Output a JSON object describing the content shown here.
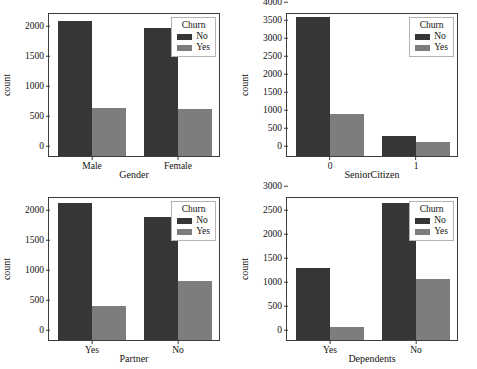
{
  "figure": {
    "top_artifact_text": "",
    "background_color": "#ffffff",
    "colors": {
      "no": "#363636",
      "yes": "#7d7d7d",
      "axis": "#3d3d3d"
    }
  },
  "legend": {
    "title": "Churn",
    "entries": [
      {
        "label": "No",
        "color": "#363636"
      },
      {
        "label": "Yes",
        "color": "#7d7d7d"
      }
    ]
  },
  "chart_data": [
    {
      "type": "bar",
      "id": "gender",
      "title": "",
      "xlabel": "Gender",
      "ylabel": "count",
      "categories": [
        "Male",
        "Female"
      ],
      "ylim": [
        0,
        2400
      ],
      "yticks": [
        0,
        500,
        1000,
        1500,
        2000
      ],
      "grid": false,
      "legend_position": "top-right",
      "legend_title": "Churn",
      "series": [
        {
          "name": "No",
          "values": [
            2250,
            2140
          ]
        },
        {
          "name": "Yes",
          "values": [
            800,
            780
          ]
        }
      ]
    },
    {
      "type": "bar",
      "id": "seniorcitizen",
      "title": "",
      "xlabel": "SeniorCitizen",
      "ylabel": "count",
      "categories": [
        "0",
        "1"
      ],
      "ylim": [
        0,
        4000
      ],
      "yticks": [
        0,
        500,
        1000,
        1500,
        2000,
        2500,
        3000,
        3500,
        4000
      ],
      "grid": false,
      "legend_position": "top-right",
      "legend_title": "Churn",
      "series": [
        {
          "name": "No",
          "values": [
            3850,
            550
          ]
        },
        {
          "name": "Yes",
          "values": [
            1180,
            380
          ]
        }
      ]
    },
    {
      "type": "bar",
      "id": "partner",
      "title": "",
      "xlabel": "Partner",
      "ylabel": "count",
      "categories": [
        "Yes",
        "No"
      ],
      "ylim": [
        0,
        2400
      ],
      "yticks": [
        0,
        500,
        1000,
        1500,
        2000
      ],
      "grid": false,
      "legend_position": "top-right",
      "legend_title": "Churn",
      "series": [
        {
          "name": "No",
          "values": [
            2280,
            2050
          ]
        },
        {
          "name": "Yes",
          "values": [
            560,
            990
          ]
        }
      ]
    },
    {
      "type": "bar",
      "id": "dependents",
      "title": "",
      "xlabel": "Dependents",
      "ylabel": "count",
      "categories": [
        "Yes",
        "No"
      ],
      "ylim": [
        0,
        3000
      ],
      "yticks": [
        0,
        500,
        1000,
        1500,
        2000,
        2500,
        3000
      ],
      "grid": false,
      "legend_position": "top-right",
      "legend_title": "Churn",
      "series": [
        {
          "name": "No",
          "values": [
            1500,
            2850
          ]
        },
        {
          "name": "Yes",
          "values": [
            265,
            1270
          ]
        }
      ]
    }
  ]
}
